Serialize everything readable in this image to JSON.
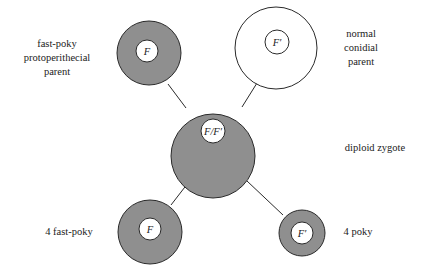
{
  "diagram": {
    "title": "",
    "colors": {
      "shaded_fill": "#8f8f8f",
      "stroke": "#2a2a2a",
      "unshaded_fill": "#ffffff"
    },
    "nodes": [
      {
        "id": "fast-poky-parent",
        "label_lines": [
          "fast-poky",
          "protoperithecial",
          "parent"
        ],
        "gene": "F",
        "shaded": true
      },
      {
        "id": "normal-parent",
        "label_lines": [
          "normal",
          "conidial",
          "parent"
        ],
        "gene": "F′",
        "shaded": false
      },
      {
        "id": "zygote",
        "label_lines": [
          "diploid zygote"
        ],
        "gene": "F/F′",
        "shaded": true
      },
      {
        "id": "fast-poky-progeny",
        "label_lines": [
          "4 fast-poky"
        ],
        "gene": "F",
        "shaded": true
      },
      {
        "id": "poky-progeny",
        "label_lines": [
          "4 poky"
        ],
        "gene": "F′",
        "shaded": true
      }
    ],
    "edges": [
      {
        "from": "fast-poky-parent",
        "to": "zygote"
      },
      {
        "from": "normal-parent",
        "to": "zygote"
      },
      {
        "from": "zygote",
        "to": "fast-poky-progeny"
      },
      {
        "from": "zygote",
        "to": "poky-progeny"
      }
    ]
  }
}
